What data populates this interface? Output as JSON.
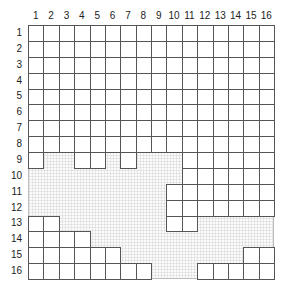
{
  "grid": {
    "columns": 16,
    "rows": 16,
    "col_labels": [
      "1",
      "2",
      "3",
      "4",
      "5",
      "6",
      "7",
      "8",
      "9",
      "10",
      "11",
      "12",
      "13",
      "14",
      "15",
      "16"
    ],
    "row_labels": [
      "1",
      "2",
      "3",
      "4",
      "5",
      "6",
      "7",
      "8",
      "9",
      "10",
      "11",
      "12",
      "13",
      "14",
      "15",
      "16"
    ],
    "filled_cells_by_row": {
      "1": [
        1,
        2,
        3,
        4,
        5,
        6,
        7,
        8,
        9,
        10,
        11,
        12,
        13,
        14,
        15,
        16
      ],
      "2": [
        1,
        2,
        3,
        4,
        5,
        6,
        7,
        8,
        9,
        10,
        11,
        12,
        13,
        14,
        15,
        16
      ],
      "3": [
        1,
        2,
        3,
        4,
        5,
        6,
        7,
        8,
        9,
        10,
        11,
        12,
        13,
        14,
        15,
        16
      ],
      "4": [
        1,
        2,
        3,
        4,
        5,
        6,
        7,
        8,
        9,
        10,
        11,
        12,
        13,
        14,
        15,
        16
      ],
      "5": [
        1,
        2,
        3,
        4,
        5,
        6,
        7,
        8,
        9,
        10,
        11,
        12,
        13,
        14,
        15,
        16
      ],
      "6": [
        1,
        2,
        3,
        4,
        5,
        6,
        7,
        8,
        9,
        10,
        11,
        12,
        13,
        14,
        15,
        16
      ],
      "7": [
        1,
        2,
        3,
        4,
        5,
        6,
        7,
        8,
        9,
        10,
        11,
        12,
        13,
        14,
        15,
        16
      ],
      "8": [
        1,
        2,
        3,
        4,
        5,
        6,
        7,
        8,
        9,
        10,
        11,
        12,
        13,
        14,
        15,
        16
      ],
      "9": [
        1,
        4,
        5,
        7,
        11,
        12,
        13,
        14,
        15,
        16
      ],
      "10": [
        11,
        12,
        13,
        14,
        15,
        16
      ],
      "11": [
        10,
        11,
        12,
        13,
        14,
        15,
        16
      ],
      "12": [
        10,
        11,
        12,
        13,
        14,
        15,
        16
      ],
      "13": [
        1,
        2,
        10,
        11
      ],
      "14": [
        1,
        2,
        3,
        4
      ],
      "15": [
        1,
        2,
        3,
        4,
        5,
        6,
        15,
        16
      ],
      "16": [
        1,
        2,
        3,
        4,
        5,
        6,
        7,
        8,
        12,
        13,
        14,
        15,
        16
      ]
    },
    "empty_region_style": "dotted",
    "colors": {
      "cell_border": "#555555",
      "empty_fill": "#fbfbfb",
      "label": "#222222"
    }
  }
}
